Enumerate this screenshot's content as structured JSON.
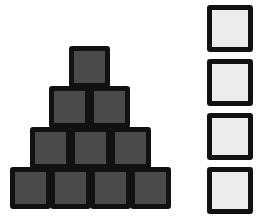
{
  "figure": {
    "colors": {
      "dark_fill": "#4a4a4a",
      "light_fill": "#ececec",
      "border": "#111111"
    },
    "pyramid": {
      "rows": [
        {
          "count": 1,
          "left": 69,
          "top": 46
        },
        {
          "count": 2,
          "left": 49,
          "top": 86
        },
        {
          "count": 3,
          "left": 30,
          "top": 127
        },
        {
          "count": 4,
          "left": 10,
          "top": 167
        }
      ],
      "block_width": 41,
      "block_height": 42
    },
    "column": {
      "count": 4,
      "left": 207,
      "width": 46,
      "height": 47,
      "tops": [
        5,
        59,
        113,
        167
      ]
    }
  }
}
